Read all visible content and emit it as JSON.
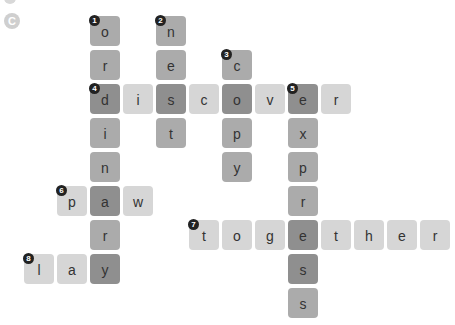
{
  "header": {
    "partial_text": "…………",
    "section_label": "C"
  },
  "grid": {
    "origin_x": 90,
    "origin_y": 16,
    "step_x": 33,
    "step_y": 34
  },
  "colors": {
    "light": "#d6d6d6",
    "mid": "#ababab",
    "dark": "#8f8f8f",
    "number_badge": "#222222"
  },
  "clues": [
    {
      "number": "1",
      "word": "ordinary",
      "direction": "down"
    },
    {
      "number": "2",
      "word": "nest",
      "direction": "down"
    },
    {
      "number": "3",
      "word": "copy",
      "direction": "down"
    },
    {
      "number": "4",
      "word": "discover",
      "direction": "across"
    },
    {
      "number": "5",
      "word": "express",
      "direction": "down"
    },
    {
      "number": "6",
      "word": "paw",
      "direction": "across"
    },
    {
      "number": "7",
      "word": "together",
      "direction": "across"
    },
    {
      "number": "8",
      "word": "lay",
      "direction": "across"
    }
  ],
  "tiles": [
    {
      "c": 0,
      "r": 0,
      "ch": "o",
      "shade": "mid",
      "num": "1"
    },
    {
      "c": 0,
      "r": 1,
      "ch": "r",
      "shade": "mid"
    },
    {
      "c": 0,
      "r": 2,
      "ch": "d",
      "shade": "dark",
      "num": "4"
    },
    {
      "c": 0,
      "r": 3,
      "ch": "i",
      "shade": "mid"
    },
    {
      "c": 0,
      "r": 4,
      "ch": "n",
      "shade": "mid"
    },
    {
      "c": 0,
      "r": 5,
      "ch": "a",
      "shade": "dark"
    },
    {
      "c": 0,
      "r": 6,
      "ch": "r",
      "shade": "mid"
    },
    {
      "c": 0,
      "r": 7,
      "ch": "y",
      "shade": "dark"
    },
    {
      "c": 2,
      "r": 0,
      "ch": "n",
      "shade": "mid",
      "num": "2"
    },
    {
      "c": 2,
      "r": 1,
      "ch": "e",
      "shade": "mid"
    },
    {
      "c": 2,
      "r": 2,
      "ch": "s",
      "shade": "dark"
    },
    {
      "c": 2,
      "r": 3,
      "ch": "t",
      "shade": "mid"
    },
    {
      "c": 4,
      "r": 1,
      "ch": "c",
      "shade": "mid",
      "num": "3"
    },
    {
      "c": 4,
      "r": 2,
      "ch": "o",
      "shade": "dark"
    },
    {
      "c": 4,
      "r": 3,
      "ch": "p",
      "shade": "mid"
    },
    {
      "c": 4,
      "r": 4,
      "ch": "y",
      "shade": "mid"
    },
    {
      "c": 1,
      "r": 2,
      "ch": "i",
      "shade": "light"
    },
    {
      "c": 3,
      "r": 2,
      "ch": "c",
      "shade": "light"
    },
    {
      "c": 5,
      "r": 2,
      "ch": "v",
      "shade": "light"
    },
    {
      "c": 6,
      "r": 2,
      "ch": "e",
      "shade": "dark",
      "num": "5"
    },
    {
      "c": 7,
      "r": 2,
      "ch": "r",
      "shade": "light"
    },
    {
      "c": 6,
      "r": 3,
      "ch": "x",
      "shade": "mid"
    },
    {
      "c": 6,
      "r": 4,
      "ch": "p",
      "shade": "mid"
    },
    {
      "c": 6,
      "r": 5,
      "ch": "r",
      "shade": "mid"
    },
    {
      "c": 6,
      "r": 6,
      "ch": "e",
      "shade": "dark"
    },
    {
      "c": 6,
      "r": 7,
      "ch": "s",
      "shade": "dark"
    },
    {
      "c": 6,
      "r": 8,
      "ch": "s",
      "shade": "mid"
    },
    {
      "c": -1,
      "r": 5,
      "ch": "p",
      "shade": "light",
      "num": "6"
    },
    {
      "c": 1,
      "r": 5,
      "ch": "w",
      "shade": "light"
    },
    {
      "c": 3,
      "r": 6,
      "ch": "t",
      "shade": "light",
      "num": "7"
    },
    {
      "c": 4,
      "r": 6,
      "ch": "o",
      "shade": "light"
    },
    {
      "c": 5,
      "r": 6,
      "ch": "g",
      "shade": "light"
    },
    {
      "c": 7,
      "r": 6,
      "ch": "t",
      "shade": "light"
    },
    {
      "c": 8,
      "r": 6,
      "ch": "h",
      "shade": "light"
    },
    {
      "c": 9,
      "r": 6,
      "ch": "e",
      "shade": "light"
    },
    {
      "c": 10,
      "r": 6,
      "ch": "r",
      "shade": "light"
    },
    {
      "c": -2,
      "r": 7,
      "ch": "l",
      "shade": "light",
      "num": "8"
    },
    {
      "c": -1,
      "r": 7,
      "ch": "a",
      "shade": "light"
    }
  ]
}
